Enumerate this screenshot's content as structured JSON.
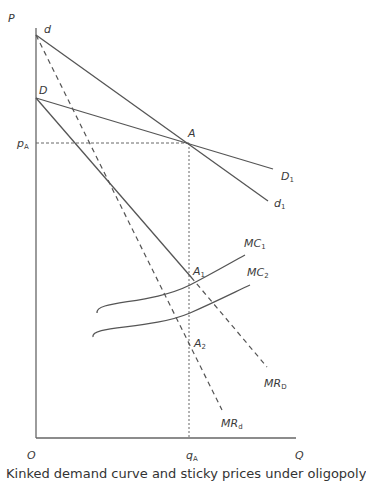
{
  "diagram": {
    "type": "kinked-demand-oligopoly",
    "axes": {
      "y_label": "P",
      "x_label": "Q",
      "origin_label": "O"
    },
    "points": {
      "d": "d",
      "D": "D",
      "A": "A",
      "A1": {
        "main": "A",
        "sub": "1"
      },
      "A2": {
        "main": "A",
        "sub": "2"
      }
    },
    "axis_markers": {
      "pA": {
        "main": "p",
        "sub": "A"
      },
      "qA": {
        "main": "q",
        "sub": "A"
      }
    },
    "curves": {
      "D1": {
        "main": "D",
        "sub": "1"
      },
      "d1": {
        "main": "d",
        "sub": "1"
      },
      "MC1": {
        "main": "MC",
        "sub": "1"
      },
      "MC2": {
        "main": "MC",
        "sub": "2"
      },
      "MRD": {
        "main": "MR",
        "sub": "D"
      },
      "MRd": {
        "main": "MR",
        "sub": "d"
      }
    },
    "colors": {
      "line": "#555555",
      "text": "#3a3a3a"
    },
    "caption_partial": "Kinked demand curve and sticky prices under oligopoly"
  }
}
